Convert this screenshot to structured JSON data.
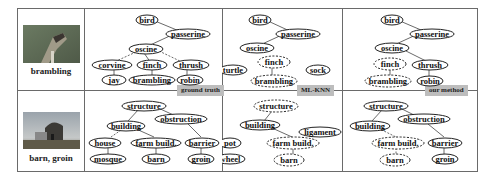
{
  "columns": {
    "ground_truth_label": "ground truth",
    "mlknn_label": "ML-KNN",
    "our_method_label": "our method"
  },
  "rows": [
    {
      "caption": "brambling",
      "image": "bird-photo",
      "ground_truth": {
        "nodes": [
          "bird",
          "passerine",
          "oscine",
          "corvine",
          "finch",
          "thrush",
          "jay",
          "brambling",
          "robin"
        ]
      },
      "mlknn": {
        "nodes": [
          "bird",
          "passerine",
          "oscine",
          "finch",
          "turtle",
          "sock",
          "brambling"
        ]
      },
      "our_method": {
        "nodes": [
          "bird",
          "passerine",
          "oscine",
          "finch",
          "thrush",
          "brambling",
          "robin"
        ]
      }
    },
    {
      "caption": "barn, groin",
      "image": "barn-photo",
      "ground_truth": {
        "nodes": [
          "structure",
          "obstruction",
          "building",
          "house",
          "farm build.",
          "barrier",
          "mosque",
          "barn",
          "groin"
        ]
      },
      "mlknn": {
        "nodes": [
          "structure",
          "building",
          "ligament",
          "pot",
          "farm build.",
          "wheel",
          "barn"
        ]
      },
      "our_method": {
        "nodes": [
          "structure",
          "obstruction",
          "building",
          "farm build.",
          "barrier",
          "barn",
          "groin"
        ]
      }
    }
  ]
}
